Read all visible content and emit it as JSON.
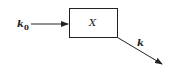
{
  "diagram": {
    "input_label": "k",
    "input_subscript": "0",
    "box_label": "X",
    "output_label": "k",
    "colors": {
      "stroke": "#222222",
      "background": "#ffffff"
    }
  }
}
